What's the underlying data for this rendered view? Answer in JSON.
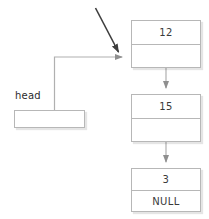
{
  "diagram": {
    "colors": {
      "background": "#ffffff",
      "box_border": "#b7b7b7",
      "connector": "#b0b0b0",
      "annotation_arrow": "#3d3d3d",
      "text": "#3a3a3a"
    },
    "pointer": {
      "label": "head",
      "box_value": ""
    },
    "nodes": [
      {
        "id": "node-1",
        "data": "12",
        "next": ""
      },
      {
        "id": "node-2",
        "data": "15",
        "next": ""
      },
      {
        "id": "node-3",
        "data": "3",
        "next": "NULL"
      }
    ],
    "connectors": [
      {
        "name": "head-to-node-1",
        "from": "head",
        "to": "node-1"
      },
      {
        "name": "node-1-to-node-2",
        "from": "node-1",
        "to": "node-2"
      },
      {
        "name": "node-2-to-node-3",
        "from": "node-2",
        "to": "node-3"
      }
    ],
    "annotation": {
      "name": "pointer-annotation-arrow",
      "target": "node-1"
    }
  }
}
